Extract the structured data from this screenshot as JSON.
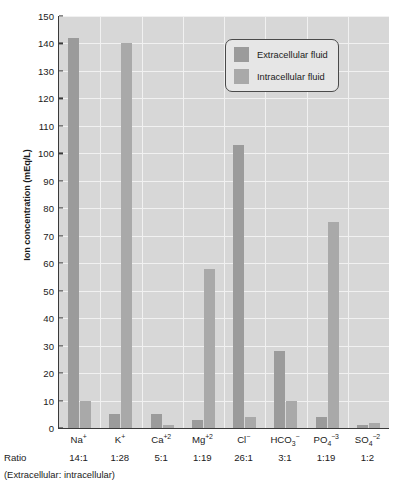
{
  "chart_data": {
    "type": "bar",
    "title": "",
    "xlabel": "",
    "ylabel": "Ion concentration (mEq/L)",
    "ylim": [
      0,
      150
    ],
    "ytick_step": 10,
    "yticks": [
      0,
      10,
      20,
      30,
      40,
      50,
      60,
      70,
      80,
      90,
      100,
      110,
      120,
      130,
      140,
      150
    ],
    "grid": true,
    "legend_position": "top-right",
    "categories": [
      "Na+",
      "K+",
      "Ca+2",
      "Mg+2",
      "Cl-",
      "HCO3-",
      "PO4-3",
      "SO4-2"
    ],
    "category_labels": [
      {
        "base": "Na",
        "sup": "+",
        "sub": ""
      },
      {
        "base": "K",
        "sup": "+",
        "sub": ""
      },
      {
        "base": "Ca",
        "sup": "+2",
        "sub": ""
      },
      {
        "base": "Mg",
        "sup": "+2",
        "sub": ""
      },
      {
        "base": "Cl",
        "sup": "−",
        "sub": ""
      },
      {
        "base": "HCO",
        "sup": "−",
        "sub": "3"
      },
      {
        "base": "PO",
        "sup": "−3",
        "sub": "4"
      },
      {
        "base": "SO",
        "sup": "−2",
        "sub": "4"
      }
    ],
    "series": [
      {
        "name": "Extracellular fluid",
        "color": "#9b9b9b",
        "values": [
          142,
          5,
          5,
          3,
          103,
          28,
          4,
          1
        ]
      },
      {
        "name": "Intracellular fluid",
        "color": "#a9a9a9",
        "values": [
          10,
          140,
          1,
          58,
          4,
          10,
          75,
          2
        ]
      }
    ],
    "ratios_label": "Ratio",
    "ratios": [
      "14:1",
      "1:28",
      "5:1",
      "1:19",
      "26:1",
      "3:1",
      "1:19",
      "1:2"
    ],
    "footnote": "(Extracellular: intracellular)"
  },
  "legend": {
    "items": [
      {
        "label": "Extracellular fluid"
      },
      {
        "label": "Intracellular fluid"
      }
    ]
  },
  "colors": {
    "plot_background": "#d7d7d7",
    "gridline": "#f1f1f1",
    "axis": "#3a3a3a",
    "extracellular": "#9b9b9b",
    "intracellular": "#a9a9a9",
    "legend_background": "#e6e6e6",
    "text": "#1b1b1b"
  }
}
